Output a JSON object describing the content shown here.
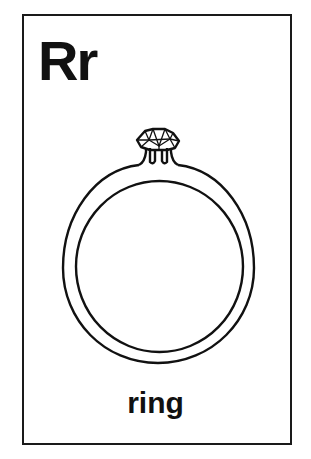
{
  "card": {
    "letter_pair": "Rr",
    "word": "ring",
    "illustration": "ring-with-diamond-icon"
  },
  "colors": {
    "ink": "#111111",
    "background": "#ffffff"
  }
}
